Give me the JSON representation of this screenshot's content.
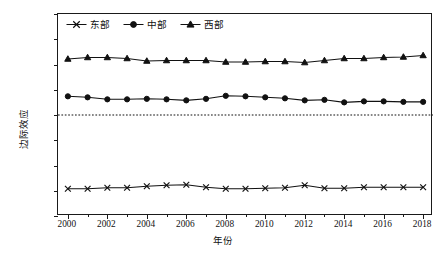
{
  "chart_data": {
    "type": "line",
    "title": "",
    "xlabel": "年份",
    "ylabel": "边际效应",
    "x": [
      2000,
      2001,
      2002,
      2003,
      2004,
      2005,
      2006,
      2007,
      2008,
      2009,
      2010,
      2011,
      2012,
      2013,
      2014,
      2015,
      2016,
      2017,
      2018
    ],
    "xlim": [
      1999.5,
      2018.5
    ],
    "ylim": [
      -0.2,
      0.2
    ],
    "xticks": [
      2000,
      2002,
      2004,
      2006,
      2008,
      2010,
      2012,
      2014,
      2016,
      2018
    ],
    "xtick_labels": [
      "2000",
      "2002",
      "2004",
      "2006",
      "2008",
      "2010",
      "2012",
      "2014",
      "2016",
      "2018"
    ],
    "xticks_minor": [
      2001,
      2003,
      2005,
      2007,
      2009,
      2011,
      2013,
      2015,
      2017
    ],
    "yticks": [
      0.2,
      0.15,
      0.1,
      0.05,
      0.0,
      -0.05,
      -0.1,
      -0.15,
      -0.2
    ],
    "ytick_labels": [
      "0.20",
      "0.15",
      "0.10",
      "0.05",
      "0.00",
      "-0.05",
      "-0.10",
      "-0.15",
      "-0.20"
    ],
    "grid": false,
    "legend_position": "top-left-inside",
    "reference_line": {
      "y": 0.0,
      "style": "dotted"
    },
    "series": [
      {
        "name": "东部",
        "marker": "x",
        "values": [
          -0.146,
          -0.146,
          -0.144,
          -0.144,
          -0.141,
          -0.139,
          -0.138,
          -0.143,
          -0.146,
          -0.146,
          -0.145,
          -0.144,
          -0.139,
          -0.145,
          -0.145,
          -0.143,
          -0.143,
          -0.143,
          -0.143
        ]
      },
      {
        "name": "中部",
        "marker": "circle",
        "values": [
          0.037,
          0.035,
          0.031,
          0.031,
          0.032,
          0.031,
          0.029,
          0.032,
          0.038,
          0.037,
          0.035,
          0.033,
          0.029,
          0.03,
          0.025,
          0.027,
          0.027,
          0.026,
          0.026
        ]
      },
      {
        "name": "西部",
        "marker": "triangle",
        "values": [
          0.111,
          0.114,
          0.114,
          0.112,
          0.107,
          0.108,
          0.108,
          0.108,
          0.105,
          0.105,
          0.106,
          0.106,
          0.104,
          0.108,
          0.112,
          0.112,
          0.114,
          0.115,
          0.118
        ]
      }
    ]
  },
  "legend": {
    "items": [
      {
        "label": "东部",
        "marker": "x"
      },
      {
        "label": "中部",
        "marker": "circle"
      },
      {
        "label": "西部",
        "marker": "triangle"
      }
    ]
  },
  "axes": {
    "x_title": "年份",
    "y_title": "边际效应"
  }
}
